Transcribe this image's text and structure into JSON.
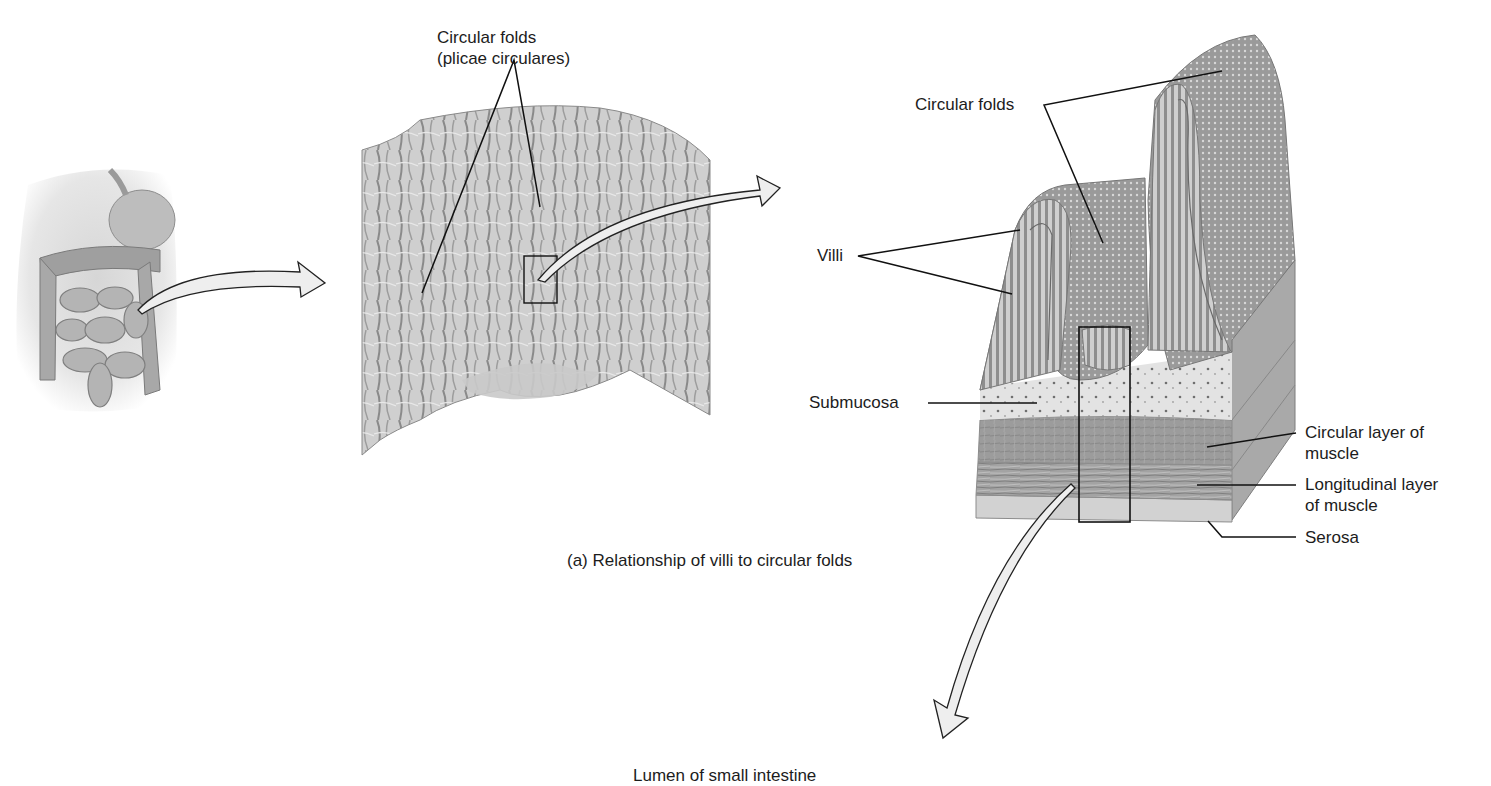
{
  "figure": {
    "caption": "(a) Relationship of villi to circular folds",
    "panels": [
      {
        "id": "abdomen",
        "description": "Illustration of abdominal organs showing small intestine"
      },
      {
        "id": "intestine-section",
        "description": "Photograph of opened small intestine segment showing circular folds"
      },
      {
        "id": "fold-cross-section",
        "description": "Cutaway illustration of circular folds with villi and wall layers"
      }
    ],
    "labels": {
      "circular_folds_line1": "Circular folds",
      "circular_folds_line2": "(plicae circulares)",
      "circular_folds_right": "Circular folds",
      "villi": "Villi",
      "submucosa": "Submucosa",
      "circular_muscle_line1": "Circular layer of",
      "circular_muscle_line2": "muscle",
      "longitudinal_muscle_line1": "Longitudinal layer",
      "longitudinal_muscle_line2": "of muscle",
      "serosa": "Serosa",
      "lumen": "Lumen of small intestine"
    },
    "colors": {
      "background": "#ffffff",
      "text": "#1c1c1c",
      "leader_line": "#111111",
      "tissue_light": "#d9d9d9",
      "tissue_mid": "#a9a9a9",
      "tissue_dark": "#7f7f7f",
      "arrow_fill": "#eeeeee"
    }
  }
}
